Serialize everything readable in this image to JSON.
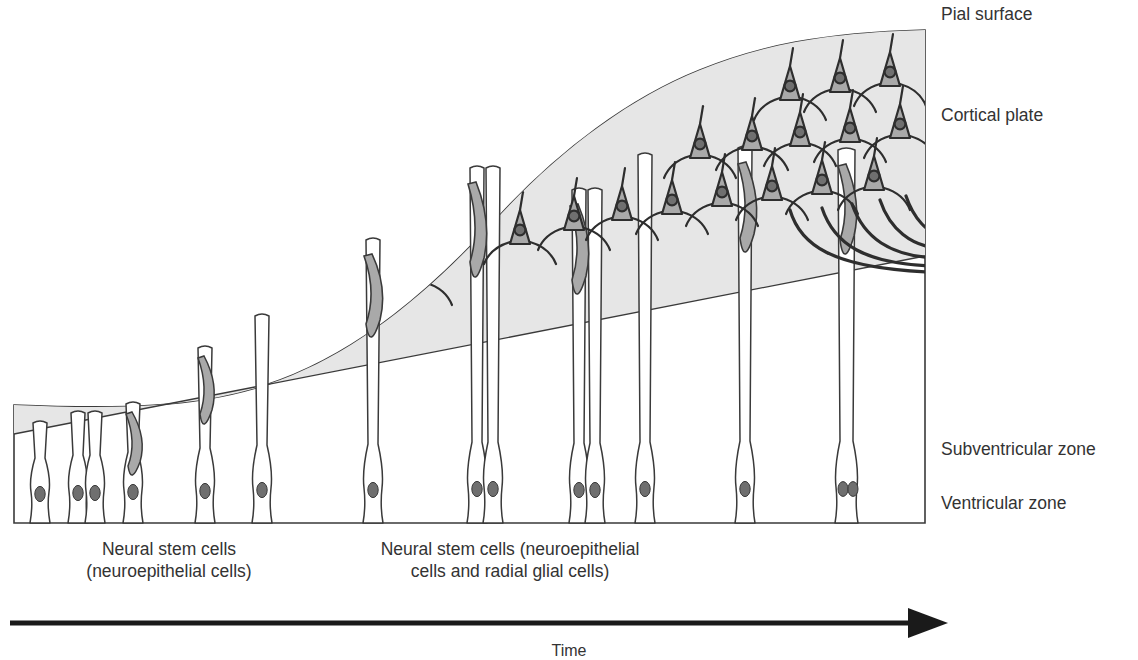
{
  "figure": {
    "type": "schematic-diagram"
  },
  "labels": {
    "pial_surface": "Pial surface",
    "cortical_plate": "Cortical plate",
    "subventricular_zone": "Subventricular zone",
    "ventricular_zone": "Ventricular zone"
  },
  "captions": {
    "left": "Neural stem cells\n(neuroepithelial cells)",
    "left_line1": "Neural stem cells",
    "left_line2": "(neuroepithelial cells)",
    "right_line1": "Neural stem cells (neuroepithelial",
    "right_line2": "cells and radial glial cells)"
  },
  "axis": {
    "time_label": "Time",
    "arrow_direction": "left-to-right"
  },
  "colors": {
    "background": "#ffffff",
    "cortical_plate_fill": "#e6e6e6",
    "tissue_outline": "#3a3a3a",
    "cell_body_fill": "#a9a9a9",
    "nucleus_fill": "#6f6f6f",
    "glia_fiber_fill": "#ffffff",
    "text": "#333333",
    "arrow": "#1a1a1a"
  },
  "zones": {
    "order_top_to_bottom": [
      "Pial surface",
      "Cortical plate",
      "Subventricular zone",
      "Ventricular zone"
    ]
  },
  "cells": {
    "neuroepithelial_columns_left": 5,
    "radial_glia_columns_right": 7,
    "migrating_neurons": 4,
    "cortical_plate_neurons": 17,
    "descending_axons": 5
  }
}
